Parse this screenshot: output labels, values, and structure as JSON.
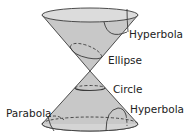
{
  "diagram": {
    "labels": {
      "hyperbola_top": "Hyperbola",
      "ellipse": "Ellipse",
      "circle": "Circle",
      "parabola": "Parabola",
      "hyperbola_bottom": "Hyperbola"
    },
    "colors": {
      "cone_fill": "#c8c8c8",
      "rim_fill": "#dcdcdc",
      "stroke": "#3a3a3a",
      "text": "#222222"
    }
  }
}
